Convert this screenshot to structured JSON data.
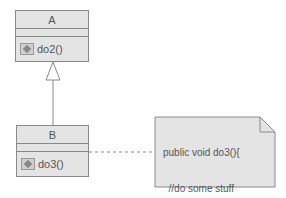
{
  "diagram": {
    "type": "uml-class",
    "classes": [
      {
        "name": "A",
        "operations": [
          "do2()"
        ]
      },
      {
        "name": "B",
        "operations": [
          "do3()"
        ]
      }
    ],
    "relations": [
      {
        "from": "B",
        "to": "A",
        "kind": "generalization"
      },
      {
        "from": "B",
        "to": "note",
        "kind": "note-anchor"
      }
    ],
    "note": {
      "lines": [
        "public void do3(){",
        "  //do some stuff",
        "  do2();",
        "}"
      ]
    },
    "colors": {
      "fill": "#e4e4e4",
      "stroke": "#8a8a8a",
      "text": "#555555"
    }
  }
}
